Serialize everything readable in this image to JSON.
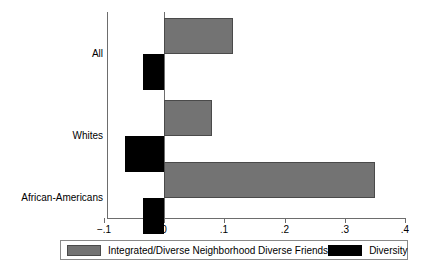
{
  "chart_data": {
    "type": "bar",
    "orientation": "horizontal",
    "title": "",
    "xlabel": "",
    "ylabel": "",
    "categories": [
      "All",
      "Whites",
      "African-Americans"
    ],
    "series": [
      {
        "name": "Integrated/Diverse Neighborhood Diverse Friends",
        "color": "#737373",
        "values": [
          0.115,
          0.08,
          0.35
        ]
      },
      {
        "name": "Diversity",
        "color": "#000000",
        "values": [
          -0.035,
          -0.065,
          -0.035
        ]
      }
    ],
    "xlim": [
      -0.1,
      0.4
    ],
    "xticks": [
      -0.1,
      0,
      0.1,
      0.2,
      0.3,
      0.4
    ],
    "xtick_labels": [
      "−.1",
      "0",
      ".1",
      ".2",
      ".3",
      ".4"
    ],
    "grid": false,
    "zero_line": true,
    "legend_position": "bottom"
  },
  "legend": {
    "items": [
      {
        "label": "Integrated/Diverse Neighborhood Diverse Friends",
        "swatch": "integrated"
      },
      {
        "label": "Diversity",
        "swatch": "diversity"
      }
    ]
  },
  "axis": {
    "x_ticks": [
      {
        "label": "−.1",
        "value": -0.1
      },
      {
        "label": "0",
        "value": 0
      },
      {
        "label": ".1",
        "value": 0.1
      },
      {
        "label": ".2",
        "value": 0.2
      },
      {
        "label": ".3",
        "value": 0.3
      },
      {
        "label": ".4",
        "value": 0.4
      }
    ],
    "y_categories": [
      "All",
      "Whites",
      "African-Americans"
    ]
  }
}
